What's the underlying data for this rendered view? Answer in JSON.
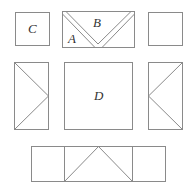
{
  "diagram": {
    "stroke_color": "#8a8a8a",
    "labels": {
      "c": "C",
      "b": "B",
      "a": "A",
      "d": "D"
    },
    "pieces": [
      {
        "name": "square-c",
        "label": "C",
        "row": 1
      },
      {
        "name": "flying-geese-ab",
        "labels": [
          "A",
          "B"
        ],
        "row": 1
      },
      {
        "name": "square-plain",
        "row": 1
      },
      {
        "name": "flying-geese-left",
        "row": 2
      },
      {
        "name": "square-d",
        "label": "D",
        "row": 2
      },
      {
        "name": "flying-geese-right",
        "row": 2
      },
      {
        "name": "strip-bottom",
        "row": 3
      }
    ]
  }
}
